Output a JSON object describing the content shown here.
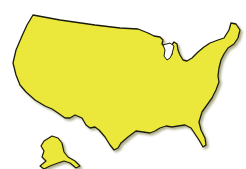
{
  "map": {
    "title": "",
    "fill_color": "#ece83a",
    "stroke_color": "#1a1a10",
    "shadow_color": "#8a8a40",
    "background_color": "#ffffff",
    "regions": [
      {
        "name": "contiguous-united-states"
      },
      {
        "name": "alaska"
      }
    ]
  }
}
